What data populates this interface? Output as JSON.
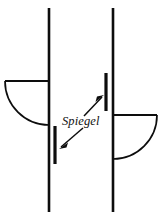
{
  "figure": {
    "width": 161,
    "height": 219,
    "background_color": "#ffffff",
    "ink_color": "#0d0d0d",
    "labels": [
      {
        "id": "spiegel",
        "text": "Spiegel",
        "style": "italic-serif",
        "x": 62,
        "y": 125
      }
    ],
    "elements": {
      "left_beam_axis": {
        "name": "left-vertical-beam-line",
        "x": 49,
        "y_top": 8,
        "y_bottom": 212
      },
      "right_beam_axis": {
        "name": "right-vertical-beam-line",
        "x": 113,
        "y_top": 8,
        "y_bottom": 212
      },
      "left_quarter_disc": {
        "name": "left-quarter-circle-element",
        "top_edge_y": 81,
        "left_x": 5,
        "right_x": 49,
        "bottom_y": 125
      },
      "right_quarter_disc": {
        "name": "right-quarter-circle-element",
        "top_edge_y": 115,
        "left_x": 113,
        "right_x": 157,
        "bottom_y": 159
      },
      "left_mirror_bar": {
        "name": "left-mirror-bar",
        "x": 55,
        "y_top": 126,
        "y_bottom": 164
      },
      "right_mirror_bar": {
        "name": "right-mirror-bar",
        "x": 106,
        "y_top": 73,
        "y_bottom": 111
      },
      "arrow_to_left_mirror": {
        "name": "arrow-to-left-mirror",
        "from_x": 83,
        "from_y": 128,
        "to_x": 60,
        "to_y": 148
      },
      "arrow_to_right_mirror": {
        "name": "arrow-to-right-mirror",
        "from_x": 84,
        "from_y": 116,
        "to_x": 104,
        "to_y": 96
      }
    }
  }
}
